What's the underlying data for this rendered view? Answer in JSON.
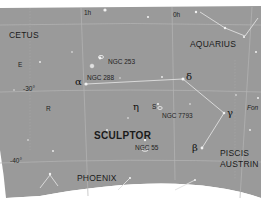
{
  "map": {
    "title": "SCULPTOR",
    "background_color": "#9a9a9a",
    "line_color": "#c8c8c8",
    "star_color": "#f2f2f2",
    "ra_labels": [
      {
        "text": "1h",
        "x": 84,
        "y": 10
      },
      {
        "text": "0h",
        "x": 173,
        "y": 12
      }
    ],
    "dec_labels": [
      {
        "text": "-30°",
        "x": 23,
        "y": 86
      },
      {
        "text": "-40°",
        "x": 10,
        "y": 158
      }
    ],
    "constellations": [
      {
        "name": "CETUS",
        "x": 9,
        "y": 31,
        "bold": false
      },
      {
        "name": "AQUARIUS",
        "x": 190,
        "y": 40,
        "bold": false
      },
      {
        "name": "SCULPTOR",
        "x": 94,
        "y": 131,
        "bold": true
      },
      {
        "name": "PISCIS",
        "x": 220,
        "y": 149,
        "bold": false
      },
      {
        "name": "AUSTRIN",
        "x": 220,
        "y": 160,
        "bold": false
      },
      {
        "name": "PHOENIX",
        "x": 77,
        "y": 174,
        "bold": false
      }
    ],
    "star_letters": [
      {
        "text": "E",
        "x": 18,
        "y": 62
      },
      {
        "text": "R",
        "x": 46,
        "y": 106
      },
      {
        "text": "S",
        "x": 152,
        "y": 104
      }
    ],
    "greek_letters": [
      {
        "text": "α",
        "x": 75,
        "y": 77
      },
      {
        "text": "δ",
        "x": 186,
        "y": 72
      },
      {
        "text": "η",
        "x": 133,
        "y": 102
      },
      {
        "text": "γ",
        "x": 227,
        "y": 108
      },
      {
        "text": "β",
        "x": 192,
        "y": 143
      }
    ],
    "deep_sky_objects": [
      {
        "name": "NGC 253",
        "x": 108,
        "y": 59
      },
      {
        "name": "NGC 288",
        "x": 87,
        "y": 75
      },
      {
        "name": "NGC 7793",
        "x": 162,
        "y": 113
      },
      {
        "name": "NGC 55",
        "x": 135,
        "y": 145
      }
    ],
    "partial_labels": [
      {
        "text": "Fon",
        "x": 247,
        "y": 105
      }
    ]
  }
}
